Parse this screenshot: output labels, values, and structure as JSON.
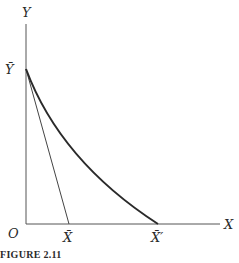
{
  "figure": {
    "caption": "FIGURE 2.11",
    "colors": {
      "axis": "#555555",
      "curve": "#2a2a2a",
      "line": "#444444",
      "text": "#2a2a2a"
    },
    "labels": {
      "y_axis": "Y",
      "x_axis": "X",
      "origin": "O",
      "y_bar": "Ȳ",
      "x_bar": "X̄",
      "x_bar_prime": "X̄′"
    },
    "elements": {
      "straight_line": {
        "from": "Ȳ",
        "to": "X̄"
      },
      "convex_curve": {
        "from": "Ȳ",
        "to": "X̄′"
      }
    }
  }
}
